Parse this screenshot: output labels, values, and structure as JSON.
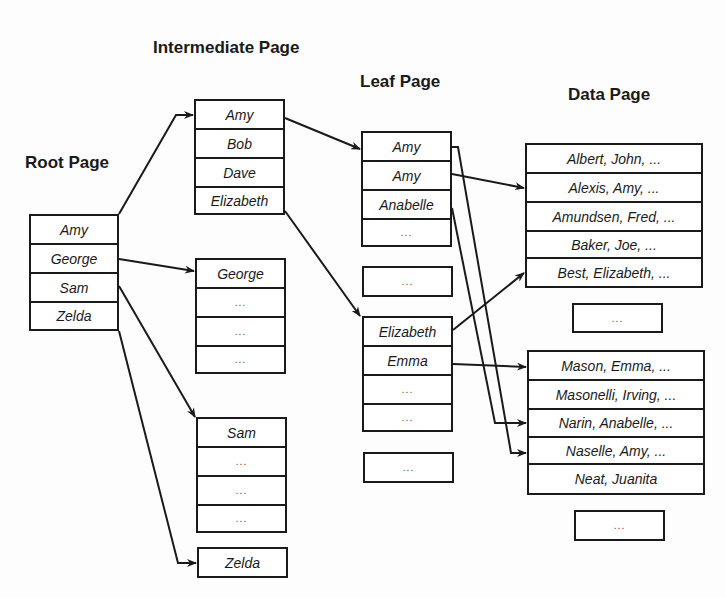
{
  "headings": {
    "root": "Root Page",
    "intermediate": "Intermediate Page",
    "leaf": "Leaf Page",
    "data": "Data Page"
  },
  "root_page": [
    "Amy",
    "George",
    "Sam",
    "Zelda"
  ],
  "intermediate_pages": [
    [
      "Amy",
      "Bob",
      "Dave",
      "Elizabeth"
    ],
    [
      "George",
      "...",
      "...",
      "..."
    ],
    [
      "Sam",
      "...",
      "...",
      "..."
    ],
    [
      "Zelda"
    ]
  ],
  "leaf_pages": [
    [
      "Amy",
      "Amy",
      "Anabelle",
      "..."
    ],
    [
      "..."
    ],
    [
      "Elizabeth",
      "Emma",
      "...",
      "..."
    ],
    [
      "..."
    ]
  ],
  "data_pages": [
    [
      "Albert, John, ...",
      "Alexis, Amy, ...",
      "Amundsen, Fred, ...",
      "Baker, Joe, ...",
      "Best, Elizabeth, ..."
    ],
    [
      "..."
    ],
    [
      "Mason, Emma, ...",
      "Masonelli, Irving, ...",
      "Narin, Anabelle, ...",
      "Naselle, Amy, ...",
      "Neat, Juanita"
    ],
    [
      "..."
    ]
  ],
  "links": [
    {
      "from": "Root:Amy",
      "to": "Intermediate[0]"
    },
    {
      "from": "Root:George",
      "to": "Intermediate[1]"
    },
    {
      "from": "Root:Sam",
      "to": "Intermediate[2]"
    },
    {
      "from": "Root:Zelda",
      "to": "Intermediate[3]"
    },
    {
      "from": "Intermediate[0]:Amy",
      "to": "Leaf[0]"
    },
    {
      "from": "Intermediate[0]:Elizabeth",
      "to": "Leaf[2]"
    },
    {
      "from": "Leaf[0]:Amy(1)",
      "to": "Data:Naselle, Amy"
    },
    {
      "from": "Leaf[0]:Amy(2)",
      "to": "Data:Alexis, Amy"
    },
    {
      "from": "Leaf[0]:Anabelle",
      "to": "Data:Narin, Anabelle"
    },
    {
      "from": "Leaf[2]:Elizabeth",
      "to": "Data:Best, Elizabeth"
    },
    {
      "from": "Leaf[2]:Emma",
      "to": "Data:Mason, Emma"
    }
  ]
}
